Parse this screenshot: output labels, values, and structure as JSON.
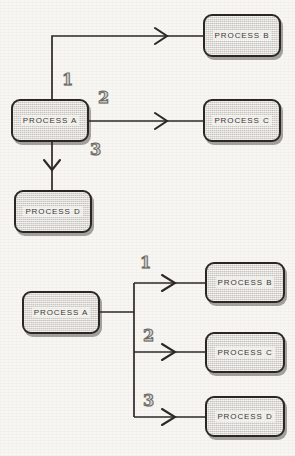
{
  "page": {
    "background_color": "#f7f6f2",
    "width": 295,
    "height": 456
  },
  "style": {
    "node_fill": "#dedbd4",
    "node_border": "#2a2724",
    "line_color": "#2d2a26",
    "label_color": "#3a3733",
    "numeral_color": "#6d6a64"
  },
  "diagrams": [
    {
      "id": "top-diagram",
      "name": "separate-branches",
      "source": {
        "label": "PROCESS A"
      },
      "branches": [
        {
          "number": "1",
          "target": "PROCESS B",
          "direction": "up-right"
        },
        {
          "number": "2",
          "target": "PROCESS C",
          "direction": "right"
        },
        {
          "number": "3",
          "target": "PROCESS D",
          "direction": "down"
        }
      ],
      "nodes": [
        {
          "id": "t-a",
          "label": "PROCESS A",
          "x": 11,
          "y": 99,
          "w": 78,
          "h": 43
        },
        {
          "id": "t-b",
          "label": "PROCESS B",
          "x": 203,
          "y": 14,
          "w": 78,
          "h": 43
        },
        {
          "id": "t-c",
          "label": "PROCESS C",
          "x": 203,
          "y": 99,
          "w": 78,
          "h": 43
        },
        {
          "id": "t-d",
          "label": "PROCESS D",
          "x": 14,
          "y": 190,
          "w": 78,
          "h": 43
        }
      ],
      "numerals": [
        {
          "value": "1",
          "x": 62,
          "y": 72
        },
        {
          "value": "2",
          "x": 98,
          "y": 90
        },
        {
          "value": "3",
          "x": 90,
          "y": 142
        }
      ]
    },
    {
      "id": "bottom-diagram",
      "name": "bus-fanout",
      "source": {
        "label": "PROCESS A"
      },
      "branches": [
        {
          "number": "1",
          "target": "PROCESS B",
          "direction": "up-right"
        },
        {
          "number": "2",
          "target": "PROCESS C",
          "direction": "right"
        },
        {
          "number": "3",
          "target": "PROCESS D",
          "direction": "down-right"
        }
      ],
      "nodes": [
        {
          "id": "b-a",
          "label": "PROCESS A",
          "x": 22,
          "y": 291,
          "w": 78,
          "h": 43
        },
        {
          "id": "b-b",
          "label": "PROCESS B",
          "x": 205,
          "y": 262,
          "w": 80,
          "h": 41
        },
        {
          "id": "b-c",
          "label": "PROCESS C",
          "x": 205,
          "y": 332,
          "w": 80,
          "h": 41
        },
        {
          "id": "b-d",
          "label": "PROCESS D",
          "x": 205,
          "y": 396,
          "w": 80,
          "h": 41
        }
      ],
      "numerals": [
        {
          "value": "1",
          "x": 140,
          "y": 255
        },
        {
          "value": "2",
          "x": 143,
          "y": 328
        },
        {
          "value": "3",
          "x": 143,
          "y": 393
        }
      ]
    }
  ]
}
